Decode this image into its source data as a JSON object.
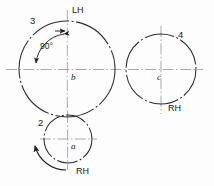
{
  "diagram": {
    "background_color": "#fdfdfd",
    "line_color": "#2b2b2b",
    "centerline_color": "#9a9a9a",
    "labels": {
      "gear3": "3",
      "gear4": "4",
      "gear2": "2",
      "center_a": "a",
      "center_b": "b",
      "center_c": "c",
      "hand_top": "LH",
      "hand_right": "RH",
      "hand_bottom": "RH",
      "angle": "90°"
    },
    "elements": [
      {
        "name": "large-circle-left",
        "label": "3",
        "center_label": "b",
        "hand": "LH",
        "cx": 67,
        "cy": 69,
        "r": 48
      },
      {
        "name": "large-circle-right",
        "label": "4",
        "center_label": "c",
        "hand": "RH",
        "cx": 161,
        "cy": 69,
        "r": 35
      },
      {
        "name": "small-circle-bottom",
        "label": "2",
        "center_label": "a",
        "hand": "RH",
        "cx": 68,
        "cy": 139,
        "r": 24
      }
    ],
    "annotations": [
      {
        "name": "angle-arc-90",
        "text": "90°",
        "arrow_ends": "both"
      },
      {
        "name": "rotation-arrow-gear2",
        "direction": "counterclockwise"
      }
    ]
  }
}
